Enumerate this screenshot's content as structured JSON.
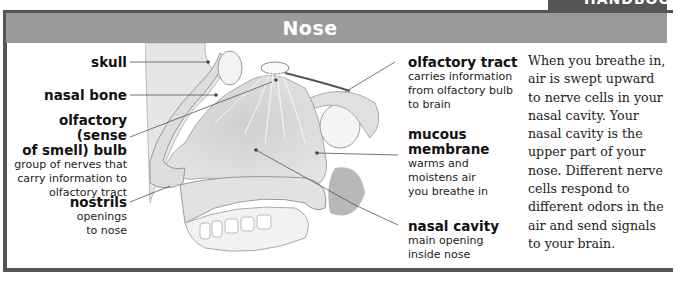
{
  "header": {
    "title": "Nose",
    "corner_tab": "HANDBOOK",
    "bar_color": "#9a9a9a",
    "tab_color": "#555555"
  },
  "labels": {
    "skull": {
      "name": "skull"
    },
    "nasal_bone": {
      "name": "nasal bone"
    },
    "olfactory_bulb": {
      "name_line1": "olfactory (sense",
      "name_line2": "of smell) bulb",
      "desc_line1": "group of nerves that",
      "desc_line2": "carry information to",
      "desc_line3": "olfactory tract"
    },
    "nostrils": {
      "name": "nostrils",
      "desc_line1": "openings",
      "desc_line2": "to nose"
    },
    "olfactory_tract": {
      "name": "olfactory tract",
      "desc_line1": "carries information",
      "desc_line2": "from olfactory bulb",
      "desc_line3": "to brain"
    },
    "mucous_membrane": {
      "name_line1": "mucous",
      "name_line2": "membrane",
      "desc_line1": "warms and",
      "desc_line2": "moistens air",
      "desc_line3": "you breathe in"
    },
    "nasal_cavity": {
      "name": "nasal cavity",
      "desc_line1": "main opening",
      "desc_line2": "inside nose"
    }
  },
  "body_text": "When you breathe in, air is swept upward to nerve cells in your nasal cavity. Your nasal cavity is the upper part of your nose. Different nerve cells respond to different odors in the air and send signals to your brain.",
  "image": {
    "icon": "nose-cross-section-illustration"
  }
}
